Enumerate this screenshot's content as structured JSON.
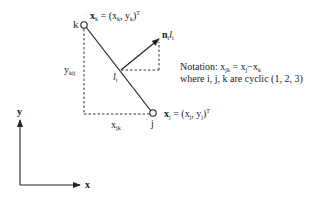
{
  "diagram": {
    "vertex_k": {
      "label": "k",
      "coord_main": "x",
      "coord_sub": "k",
      "coord_eq": " = (x",
      "coord_x_sub": "k",
      "coord_sep": ", y",
      "coord_y_sub": "k",
      "coord_close": ")",
      "coord_sup": "T"
    },
    "vertex_j": {
      "label": "j",
      "coord_main": "x",
      "coord_sub": "j",
      "coord_eq": " = (x",
      "coord_x_sub": "j",
      "coord_sep": ", y",
      "coord_y_sub": "j",
      "coord_close": ")",
      "coord_sup": "T"
    },
    "midpoint": {
      "label": "l",
      "label_sub": "i"
    },
    "normal": {
      "label_n": "n",
      "label_n_sub": "i",
      "label_l": "l",
      "label_l_sub": "i"
    },
    "y_component": {
      "label": "y",
      "label_sub": "kij"
    },
    "x_component": {
      "label": "x",
      "label_sub": "jk"
    },
    "notation": {
      "line1_prefix": "Notation: x",
      "line1_sub1": "jk",
      "line1_eq": " = x",
      "line1_sub2": "j",
      "line1_minus": "−x",
      "line1_sub3": "k",
      "line2": "where i, j, k are cyclic (1, 2, 3)"
    },
    "axes": {
      "x_label": "x",
      "y_label": "y"
    },
    "colors": {
      "stroke": "#222222",
      "dashed": "#333333"
    }
  }
}
